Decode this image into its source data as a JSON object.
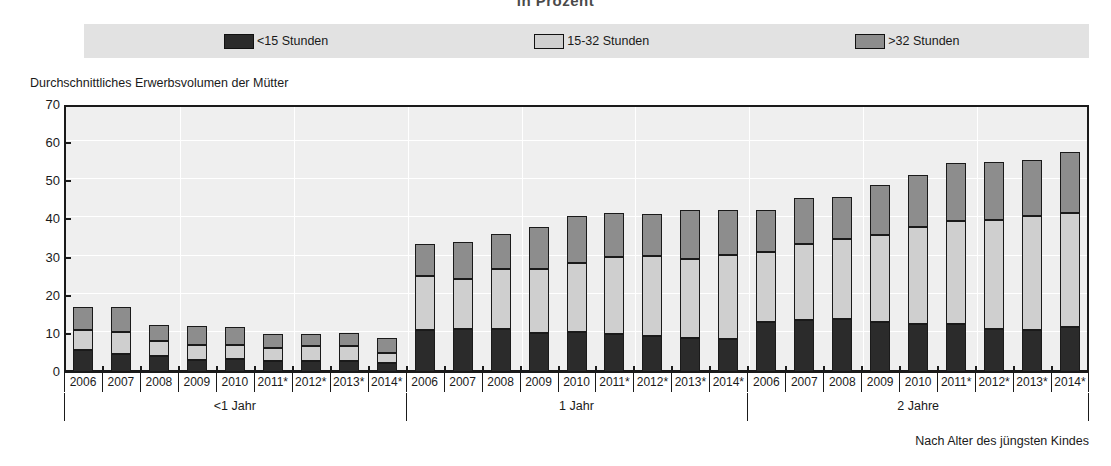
{
  "title": "in Prozent",
  "y_axis_caption": "Durchschnittliches Erwerbsvolumen der Mütter",
  "footnote": "Nach Alter des jüngsten Kindes",
  "legend": {
    "items": [
      {
        "label": "<15 Stunden",
        "color": "#2b2b2b",
        "swatch": "dark-swatch"
      },
      {
        "label": "15-32 Stunden",
        "color": "#cfcfcf",
        "swatch": "light-swatch"
      },
      {
        "label": ">32 Stunden",
        "color": "#8d8d8d",
        "swatch": "mid-swatch"
      }
    ]
  },
  "groups": [
    {
      "label": "<1 Jahr"
    },
    {
      "label": "1 Jahr"
    },
    {
      "label": "2 Jahre"
    }
  ],
  "y_ticks": [
    "70",
    "60",
    "50",
    "40",
    "30",
    "20",
    "10",
    "0"
  ],
  "chart_data": {
    "type": "bar",
    "subtype": "stacked-grouped",
    "title": "in Prozent",
    "xlabel": "Nach Alter des jüngsten Kindes",
    "ylabel": "Durchschnittliches Erwerbsvolumen der Mütter",
    "ylim": [
      0,
      70
    ],
    "ytick_values": [
      0,
      10,
      20,
      30,
      40,
      50,
      60,
      70
    ],
    "grid": true,
    "legend_position": "top",
    "group_names": [
      "<1 Jahr",
      "1 Jahr",
      "2 Jahre"
    ],
    "categories": [
      "2006",
      "2007",
      "2008",
      "2009",
      "2010",
      "2011*",
      "2012*",
      "2013*",
      "2014*"
    ],
    "series": [
      {
        "name": "<15 Stunden",
        "color": "#2b2b2b",
        "values_by_group": {
          "<1 Jahr": [
            5.9,
            4.8,
            4.1,
            3.1,
            3.3,
            3.0,
            2.8,
            3.0,
            2.3
          ],
          "1 Jahr": [
            11.0,
            11.3,
            11.4,
            10.3,
            10.5,
            9.9,
            9.4,
            8.9,
            8.6
          ],
          "2 Jahre": [
            13.1,
            13.6,
            13.8,
            13.0,
            12.7,
            12.7,
            11.3,
            10.9,
            11.9
          ]
        }
      },
      {
        "name": "15-32 Stunden",
        "color": "#cfcfcf",
        "values_by_group": {
          "<1 Jahr": [
            5.2,
            5.8,
            4.0,
            3.9,
            3.8,
            3.2,
            4.0,
            3.9,
            2.8
          ],
          "1 Jahr": [
            14.2,
            13.2,
            15.5,
            16.8,
            18.1,
            20.3,
            21.1,
            20.8,
            22.2
          ],
          "2 Jahre": [
            18.3,
            19.9,
            21.0,
            22.9,
            25.2,
            26.9,
            28.5,
            30.1,
            29.7
          ]
        }
      },
      {
        "name": ">32 Stunden",
        "color": "#8d8d8d",
        "values_by_group": {
          "<1 Jahr": [
            5.9,
            6.4,
            4.2,
            5.0,
            4.8,
            3.7,
            3.2,
            3.3,
            3.9
          ],
          "1 Jahr": [
            8.3,
            9.5,
            9.4,
            11.0,
            12.2,
            11.5,
            11.0,
            12.7,
            11.8
          ],
          "2 Jahre": [
            11.0,
            12.2,
            11.2,
            13.2,
            13.7,
            15.1,
            15.2,
            14.6,
            16.2
          ]
        }
      }
    ],
    "totals_by_group": {
      "<1 Jahr": [
        17.0,
        17.0,
        12.3,
        12.0,
        11.9,
        9.9,
        10.0,
        10.2,
        9.0
      ],
      "1 Jahr": [
        33.5,
        34.0,
        36.3,
        38.1,
        40.8,
        41.7,
        41.5,
        42.4,
        42.6
      ],
      "2 Jahre": [
        42.4,
        45.7,
        46.0,
        49.1,
        51.6,
        54.7,
        55.0,
        55.6,
        57.8
      ]
    }
  }
}
